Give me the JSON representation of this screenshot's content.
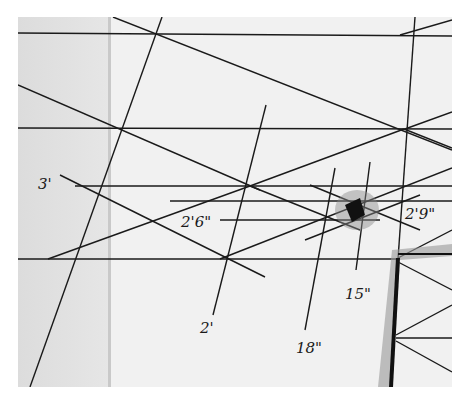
{
  "image": {
    "description": "Photograph of hand-drawn perspective sketch on paper with measurement labels",
    "labels": {
      "three_ft": "3'",
      "two_ft_six": "2'6\"",
      "two_ft_nine": "2'9\"",
      "two_ft": "2'",
      "eighteen_in": "18\"",
      "fifteen_in": "15\""
    },
    "colors": {
      "paper": "#f1f1f1",
      "paper_shadow": "#dcdcdc",
      "ink": "#1a1a1a",
      "gray_marker": "#9a9a9a"
    }
  }
}
